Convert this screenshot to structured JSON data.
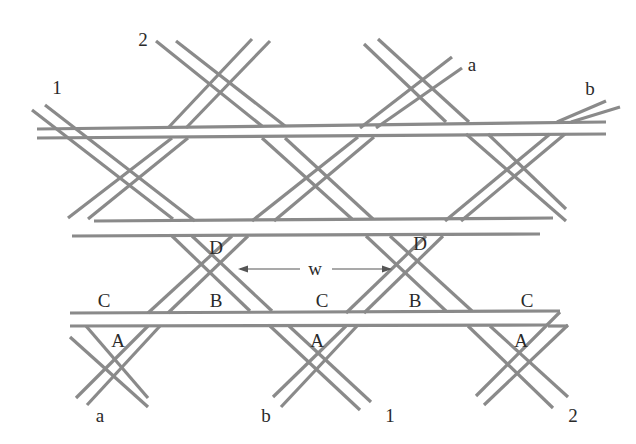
{
  "figure": {
    "type": "woven-strip-lattice",
    "strip_color": "#8a8a8a",
    "label_color": "#2a2a2a",
    "background": "#ffffff"
  },
  "labels": {
    "strip_1_top": "1",
    "strip_2_top": "2",
    "strip_a_top": "a",
    "strip_b_top": "b",
    "strip_a_bottom": "a",
    "strip_b_bottom": "b",
    "strip_1_bottom": "1",
    "strip_2_bottom": "2",
    "hole_D_left": "D",
    "hole_D_right": "D",
    "hole_B_left": "B",
    "hole_B_right": "B",
    "hole_C_left": "C",
    "hole_C_middle": "C",
    "hole_C_right": "C",
    "hole_A_left": "A",
    "hole_A_middle": "A",
    "hole_A_right": "A",
    "width_marker": "w"
  },
  "width_dimension": {
    "label": "w",
    "from_x": 238,
    "to_x": 392,
    "y": 269
  }
}
